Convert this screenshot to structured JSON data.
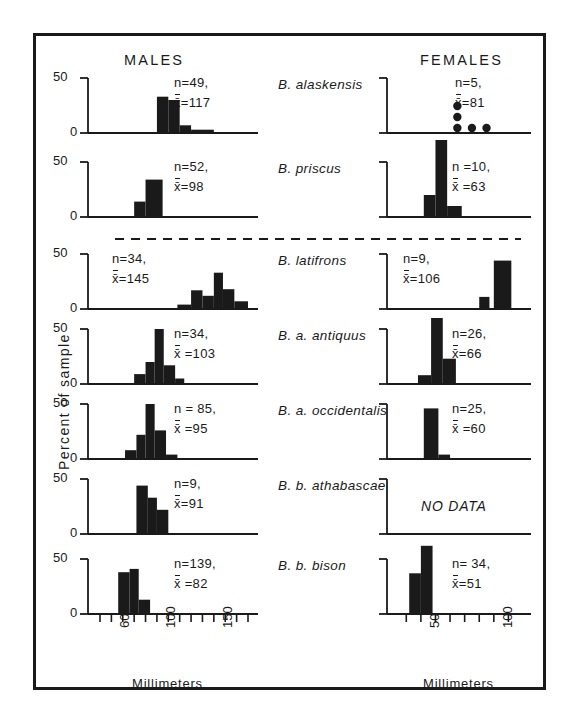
{
  "figure": {
    "column_headers": {
      "males": "MALES",
      "females": "FEMALES"
    },
    "y_axis_label": "Percent of sample",
    "x_axis_title": "Millimeters",
    "y_tick_top": "50",
    "y_tick_bottom": "0",
    "no_data_label": "NO DATA",
    "ink_color": "#1a1a1a"
  },
  "chart_data": {
    "type": "bar",
    "xlabel": "Millimeters",
    "ylabel": "Percent of sample",
    "ylim": [
      0,
      50
    ],
    "grid": false,
    "legend": "none",
    "male_axis": {
      "xlim": [
        50,
        180
      ],
      "tick_step": 10,
      "tick_values": [
        50,
        60,
        70,
        80,
        90,
        100,
        110,
        120,
        130,
        140,
        150,
        160,
        170,
        180
      ],
      "labeled_ticks": [
        {
          "value": 60,
          "label": "60"
        },
        {
          "value": 100,
          "label": "100"
        },
        {
          "value": 150,
          "label": "150"
        }
      ]
    },
    "female_axis": {
      "xlim": [
        35,
        120
      ],
      "tick_step": 10,
      "tick_values": [
        40,
        50,
        60,
        70,
        80,
        90,
        100,
        110
      ],
      "labeled_ticks": [
        {
          "value": 50,
          "label": "50"
        },
        {
          "value": 100,
          "label": "100"
        }
      ]
    },
    "groups": [
      {
        "species": "B. alaskensis",
        "male": {
          "n_label": "n=49,",
          "mean_label": "=117",
          "n": 49,
          "mean": 117,
          "bins": [
            {
              "x0": 100,
              "x1": 110,
              "pct": 33
            },
            {
              "x0": 110,
              "x1": 120,
              "pct": 30
            },
            {
              "x0": 120,
              "x1": 130,
              "pct": 7
            },
            {
              "x0": 130,
              "x1": 150,
              "pct": 3
            }
          ]
        },
        "female": {
          "n_label": "n=5,",
          "mean_label": "=81",
          "n": 5,
          "mean": 81,
          "style": "dots",
          "dots": [
            {
              "x": 75,
              "stack": 3
            },
            {
              "x": 85,
              "stack": 1
            },
            {
              "x": 95,
              "stack": 1
            }
          ]
        }
      },
      {
        "species": "B. priscus",
        "male": {
          "n_label": "n=52,",
          "mean_label": "=98",
          "n": 52,
          "mean": 98,
          "bins": [
            {
              "x0": 80,
              "x1": 90,
              "pct": 14
            },
            {
              "x0": 90,
              "x1": 105,
              "pct": 34
            }
          ]
        },
        "female": {
          "n_label": "n =10,",
          "mean_label": " =63",
          "n": 10,
          "mean": 63,
          "bins": [
            {
              "x0": 52,
              "x1": 60,
              "pct": 20
            },
            {
              "x0": 60,
              "x1": 68,
              "pct": 70
            },
            {
              "x0": 68,
              "x1": 78,
              "pct": 10
            }
          ]
        }
      },
      {
        "species": "B. latifrons",
        "male": {
          "n_label": "n=34,",
          "mean_label": "=145",
          "n": 34,
          "mean": 145,
          "bins": [
            {
              "x0": 118,
              "x1": 130,
              "pct": 4
            },
            {
              "x0": 130,
              "x1": 140,
              "pct": 17
            },
            {
              "x0": 140,
              "x1": 150,
              "pct": 12
            },
            {
              "x0": 150,
              "x1": 158,
              "pct": 33
            },
            {
              "x0": 158,
              "x1": 168,
              "pct": 18
            },
            {
              "x0": 168,
              "x1": 180,
              "pct": 7
            }
          ]
        },
        "female": {
          "n_label": "n=9,",
          "mean_label": "=106",
          "n": 9,
          "mean": 106,
          "bins": [
            {
              "x0": 90,
              "x1": 97,
              "pct": 11
            },
            {
              "x0": 100,
              "x1": 112,
              "pct": 44
            }
          ]
        }
      },
      {
        "species": "B. a. antiquus",
        "male": {
          "n_label": "n=34,",
          "mean_label": " =103",
          "n": 34,
          "mean": 103,
          "bins": [
            {
              "x0": 80,
              "x1": 90,
              "pct": 9
            },
            {
              "x0": 90,
              "x1": 98,
              "pct": 20
            },
            {
              "x0": 98,
              "x1": 106,
              "pct": 50
            },
            {
              "x0": 106,
              "x1": 116,
              "pct": 17
            },
            {
              "x0": 116,
              "x1": 124,
              "pct": 5
            }
          ]
        },
        "female": {
          "n_label": "n=26,",
          "mean_label": "=66",
          "n": 26,
          "mean": 66,
          "bins": [
            {
              "x0": 48,
              "x1": 57,
              "pct": 8
            },
            {
              "x0": 57,
              "x1": 65,
              "pct": 60
            },
            {
              "x0": 65,
              "x1": 74,
              "pct": 23
            }
          ]
        }
      },
      {
        "species": "B. a. occidentalis",
        "male": {
          "n_label": "n = 85,",
          "mean_label": " =95",
          "n": 85,
          "mean": 95,
          "bins": [
            {
              "x0": 72,
              "x1": 82,
              "pct": 8
            },
            {
              "x0": 82,
              "x1": 90,
              "pct": 22
            },
            {
              "x0": 90,
              "x1": 98,
              "pct": 50
            },
            {
              "x0": 98,
              "x1": 108,
              "pct": 26
            },
            {
              "x0": 108,
              "x1": 118,
              "pct": 4
            }
          ]
        },
        "female": {
          "n_label": "n=25,",
          "mean_label": " =60",
          "n": 25,
          "mean": 60,
          "bins": [
            {
              "x0": 52,
              "x1": 62,
              "pct": 46
            },
            {
              "x0": 62,
              "x1": 70,
              "pct": 4
            }
          ]
        }
      },
      {
        "species": "B. b. athabascae",
        "male": {
          "n_label": "n=9,",
          "mean_label": "=91",
          "n": 9,
          "mean": 91,
          "bins": [
            {
              "x0": 82,
              "x1": 92,
              "pct": 44
            },
            {
              "x0": 92,
              "x1": 100,
              "pct": 33
            },
            {
              "x0": 100,
              "x1": 110,
              "pct": 22
            }
          ]
        },
        "female": {
          "no_data": true
        }
      },
      {
        "species": "B. b. bison",
        "male": {
          "n_label": "n=139,",
          "mean_label": " =82",
          "n": 139,
          "mean": 82,
          "bins": [
            {
              "x0": 66,
              "x1": 76,
              "pct": 38
            },
            {
              "x0": 76,
              "x1": 84,
              "pct": 41
            },
            {
              "x0": 84,
              "x1": 94,
              "pct": 13
            }
          ]
        },
        "female": {
          "n_label": "n= 34,",
          "mean_label": "=51",
          "n": 34,
          "mean": 51,
          "bins": [
            {
              "x0": 42,
              "x1": 50,
              "pct": 37
            },
            {
              "x0": 50,
              "x1": 58,
              "pct": 62
            }
          ]
        }
      }
    ]
  }
}
